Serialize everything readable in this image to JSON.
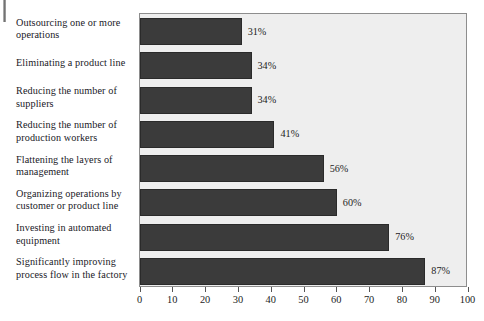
{
  "chart_data": {
    "type": "bar",
    "orientation": "horizontal",
    "title": "",
    "subtitle": "",
    "xlabel": "",
    "ylabel": "",
    "xlim": [
      0,
      100
    ],
    "grid": false,
    "legend": null,
    "bar_color": "#3b3b3b",
    "plot_background": "#eeeeee",
    "value_suffix": "%",
    "xticks": [
      0,
      10,
      20,
      30,
      40,
      50,
      60,
      70,
      80,
      90,
      100
    ],
    "xtick_labels": [
      "0",
      "10",
      "20",
      "30",
      "40",
      "50",
      "60",
      "70",
      "80",
      "90",
      "100"
    ],
    "categories": [
      "Outsourcing one or more operations",
      "Eliminating a product line",
      "Reducing the number of suppliers",
      "Reducing the number of production workers",
      "Flattening the layers of management",
      "Organizing operations by customer or product line",
      "Investing in automated equipment",
      "Significantly improving process flow in the factory"
    ],
    "category_lines": [
      [
        "Outsourcing one or more",
        "operations"
      ],
      [
        "Eliminating a product line"
      ],
      [
        "Reducing the number of",
        "suppliers"
      ],
      [
        "Reducing the number of",
        "production workers"
      ],
      [
        "Flattening the layers of",
        "management"
      ],
      [
        "Organizing operations by",
        "customer or product line"
      ],
      [
        "Investing in automated",
        "equipment"
      ],
      [
        "Significantly improving",
        "process flow in the factory"
      ]
    ],
    "values": [
      31,
      34,
      34,
      41,
      56,
      60,
      76,
      87
    ],
    "value_labels": [
      "31%",
      "34%",
      "34%",
      "41%",
      "56%",
      "60%",
      "76%",
      "87%"
    ]
  }
}
